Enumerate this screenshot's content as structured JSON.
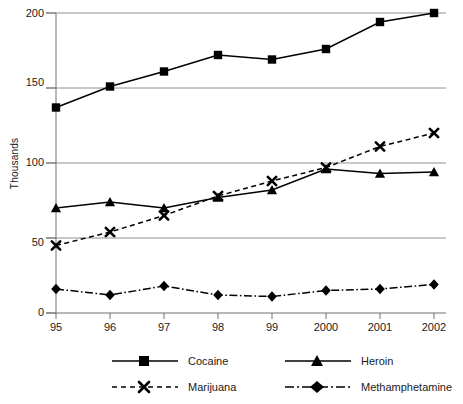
{
  "chart_data": {
    "type": "line",
    "title": "",
    "xlabel": "",
    "ylabel": "Thousands",
    "categories": [
      "95",
      "96",
      "97",
      "98",
      "99",
      "2000",
      "2001",
      "2002"
    ],
    "ylim": [
      0,
      200
    ],
    "yticks": [
      0,
      50,
      100,
      150,
      200
    ],
    "grid": "horizontal",
    "legend_position": "bottom",
    "series": [
      {
        "name": "Cocaine",
        "marker": "square",
        "line_style": "solid",
        "color": "#000000",
        "values": [
          137,
          151,
          161,
          172,
          169,
          176,
          194,
          200
        ]
      },
      {
        "name": "Heroin",
        "marker": "triangle",
        "line_style": "solid",
        "color": "#000000",
        "values": [
          70,
          74,
          70,
          77,
          82,
          96,
          93,
          94
        ]
      },
      {
        "name": "Marijuana",
        "marker": "x",
        "line_style": "dashed",
        "color": "#000000",
        "values": [
          45,
          54,
          65,
          78,
          88,
          97,
          111,
          120
        ]
      },
      {
        "name": "Methamphetamine",
        "marker": "diamond",
        "line_style": "dashdot",
        "color": "#000000",
        "values": [
          16,
          12,
          18,
          12,
          11,
          15,
          16,
          19
        ]
      }
    ]
  },
  "axis": {
    "ytick_labels": [
      "200",
      "150",
      "100",
      "50",
      "0"
    ],
    "xtick_labels": [
      "95",
      "96",
      "97",
      "98",
      "99",
      "2000",
      "2001",
      "2002"
    ],
    "ylabel": "Thousands"
  },
  "legend": {
    "entries": [
      {
        "label": "Cocaine"
      },
      {
        "label": "Heroin"
      },
      {
        "label": "Marijuana"
      },
      {
        "label": "Methamphetamine"
      }
    ]
  },
  "colors": {
    "ink": "#000000",
    "grid": "#909090",
    "axis": "#707070",
    "background": "#ffffff"
  }
}
